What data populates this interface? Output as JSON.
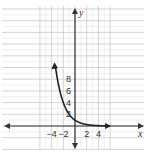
{
  "chart_data": {
    "type": "line",
    "title": "",
    "xlabel": "x",
    "ylabel": "y",
    "xlim": [
      -6.2,
      6.2
    ],
    "ylim": [
      -2.4,
      10.4
    ],
    "grid": true,
    "x_ticks": [
      {
        "value": -4,
        "label": "−4"
      },
      {
        "value": -2,
        "label": "−2"
      },
      {
        "value": 2,
        "label": "2"
      },
      {
        "value": 4,
        "label": "4"
      }
    ],
    "y_ticks": [
      {
        "value": 2,
        "label": "2"
      },
      {
        "value": 4,
        "label": "4"
      },
      {
        "value": 6,
        "label": "6"
      },
      {
        "value": 8,
        "label": "8"
      }
    ],
    "series": [
      {
        "name": "y = (1/2)^x",
        "x": [
          -3.3,
          -3,
          -2,
          -1,
          0,
          1,
          2,
          3,
          4,
          5.5
        ],
        "values": [
          9.85,
          8,
          4,
          2,
          1,
          0.5,
          0.25,
          0.125,
          0.0625,
          0.022
        ],
        "color": "#222222"
      }
    ]
  }
}
